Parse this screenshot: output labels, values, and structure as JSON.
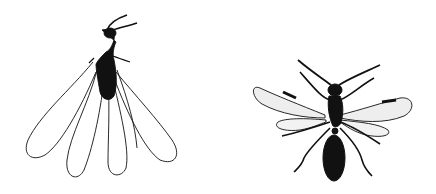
{
  "figure": {
    "background": "#ffffff",
    "ink": "#111111",
    "specimens": [
      {
        "name": "termite-alate",
        "position": "left",
        "wings": 4,
        "wing_style": "clear, long, overlapping"
      },
      {
        "name": "winged-ant",
        "position": "right",
        "wings": 4,
        "wing_style": "stippled, shorter"
      }
    ]
  }
}
